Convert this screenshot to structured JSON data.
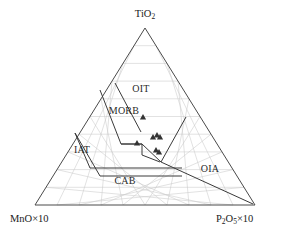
{
  "chart_data": {
    "type": "scatter",
    "plot_kind": "ternary-discrimination-diagram",
    "title": "",
    "apex_label": "TiO2",
    "left_label": "MnO×10",
    "right_label": "P2O5×10",
    "vertices": {
      "top": {
        "label_html": "TiO<sub>2</sub>",
        "x": 145,
        "y": 28
      },
      "bottom_left": {
        "label_html": "MnO×10",
        "x": 35,
        "y": 205
      },
      "bottom_right": {
        "label_html": "P<sub>2</sub>O<sub>5</sub>×10",
        "x": 255,
        "y": 205
      }
    },
    "grid": {
      "visible": true,
      "divisions": 10,
      "color": "#c9c9c9"
    },
    "axis_labels": [
      {
        "name": "apex",
        "text": "TiO2",
        "base": "TiO",
        "sub": "2",
        "x": 145,
        "y": 17
      },
      {
        "name": "bottom-left",
        "text": "MnO×10",
        "x": 10,
        "y": 222
      },
      {
        "name": "bottom-right",
        "text": "P2O5×10",
        "base1": "P",
        "sub1": "2",
        "base2": "O",
        "sub2": "5",
        "tail": "×10",
        "x": 216,
        "y": 222
      }
    ],
    "fields": [
      {
        "name": "OIT",
        "label": "OIT",
        "x": 141,
        "y": 92,
        "description": "Ocean Island Tholeiite"
      },
      {
        "name": "MORB",
        "label": "MORB",
        "x": 124,
        "y": 114,
        "description": "Mid-Ocean Ridge Basalt"
      },
      {
        "name": "IAT",
        "label": "IAT",
        "x": 82,
        "y": 153,
        "description": "Island Arc Tholeiite"
      },
      {
        "name": "CAB",
        "label": "CAB",
        "x": 125,
        "y": 184,
        "description": "Calc-Alkaline Basalt"
      },
      {
        "name": "OIA",
        "label": "OIA",
        "x": 210,
        "y": 172,
        "description": "Ocean Island Alkali basalt"
      }
    ],
    "boundary_paths": [
      {
        "name": "oit-morb-divider",
        "points": "115,83 141,132"
      },
      {
        "name": "morb-left-edge",
        "points": "100,90 121,144 142,144"
      },
      {
        "name": "iat-outline",
        "points": "75,133 100,176 182,176"
      },
      {
        "name": "iat-morb-link",
        "points": "75,133 90,168 182,168"
      },
      {
        "name": "morb-oia-v",
        "points": "142,144 161,162 186,117"
      },
      {
        "name": "cab-oia-divider",
        "points": "161,162 253,204"
      },
      {
        "name": "morb-box-bottom",
        "points": "121,144 142,144 142,155 160,162"
      }
    ],
    "data_points": [
      {
        "id": "p1",
        "x": 137,
        "y": 143,
        "marker": "triangle"
      },
      {
        "id": "p2",
        "x": 143,
        "y": 117,
        "marker": "triangle"
      },
      {
        "id": "p3",
        "x": 153,
        "y": 137,
        "marker": "triangle"
      },
      {
        "id": "p4",
        "x": 157,
        "y": 135,
        "marker": "triangle"
      },
      {
        "id": "p5",
        "x": 160,
        "y": 137,
        "marker": "triangle"
      },
      {
        "id": "p6",
        "x": 156,
        "y": 150,
        "marker": "triangle"
      },
      {
        "id": "p7",
        "x": 159,
        "y": 152,
        "marker": "triangle"
      }
    ],
    "legend": {
      "visible": false,
      "entries": []
    },
    "colors": {
      "grid": "#c9c9c9",
      "outline": "#4a4a4a",
      "boundary": "#3a3a3a",
      "marker": "#333333",
      "text": "#1a1a1a",
      "background": "#ffffff"
    }
  }
}
